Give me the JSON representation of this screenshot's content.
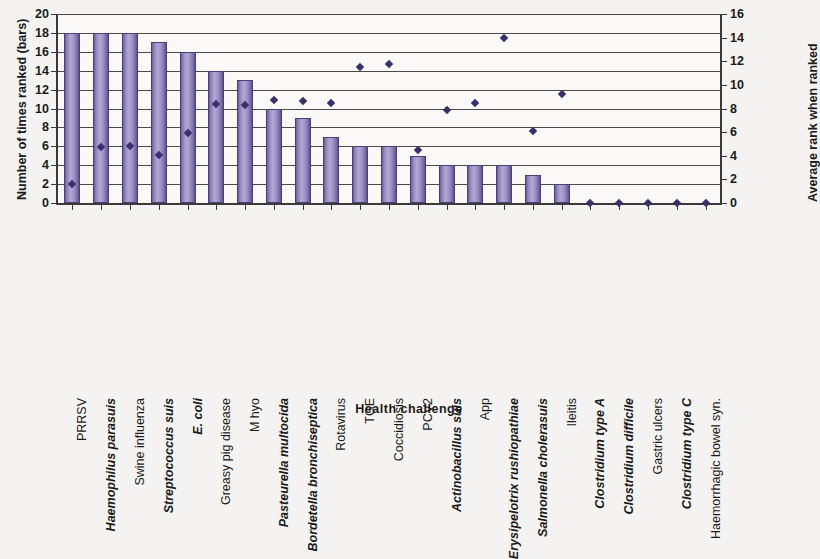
{
  "chart_data": {
    "type": "bar",
    "title": "",
    "xlabel": "Health challenge",
    "ylabel": "Number of times ranked (bars)",
    "y2label": "Average rank when ranked",
    "ylim": [
      0,
      20
    ],
    "y2lim": [
      0,
      16
    ],
    "yticks": [
      0,
      2,
      4,
      6,
      8,
      10,
      12,
      14,
      16,
      18,
      20
    ],
    "y2ticks": [
      0,
      2,
      4,
      6,
      8,
      10,
      12,
      14,
      16
    ],
    "grid": true,
    "legend": "none",
    "categories": [
      "PRRSV",
      "Haemophilus parasuis",
      "Swine influenza",
      "Streptococcus suis",
      "E. coli",
      "Greasy pig disease",
      "M hyo",
      "Pasteurella multocida",
      "Bordetella bronchiseptica",
      "Rotavirus",
      "TGE",
      "Coccidiosis",
      "PCV2",
      "Actinobacillus suis",
      "App",
      "Erysipelotrix rushiopathiae",
      "Salmonella cholerasuis",
      "Ileitis",
      "Clostridium type A",
      "Clostridium difficile",
      "Gastric ulcers",
      "Clostridium type C",
      "Haemorrhagic bowel syn."
    ],
    "category_italic": [
      false,
      true,
      false,
      true,
      true,
      false,
      false,
      true,
      true,
      false,
      false,
      false,
      false,
      true,
      false,
      true,
      true,
      false,
      true,
      true,
      false,
      true,
      false
    ],
    "series": [
      {
        "name": "Number of times ranked (bars)",
        "type": "bar",
        "axis": "left",
        "color": "#9d90c4",
        "values": [
          18,
          18,
          18,
          17,
          16,
          14,
          13,
          10,
          9,
          7,
          6,
          6,
          5,
          4,
          4,
          4,
          3,
          2,
          0,
          0,
          0,
          0,
          0
        ]
      },
      {
        "name": "Average rank when ranked",
        "type": "scatter",
        "axis": "right",
        "color": "#3b2f6e",
        "values": [
          1.6,
          4.7,
          4.8,
          4.1,
          5.9,
          8.4,
          8.3,
          8.7,
          8.6,
          8.5,
          11.5,
          11.8,
          4.5,
          7.9,
          8.5,
          14.0,
          6.1,
          9.2,
          0,
          0,
          0,
          0,
          0
        ]
      }
    ]
  }
}
